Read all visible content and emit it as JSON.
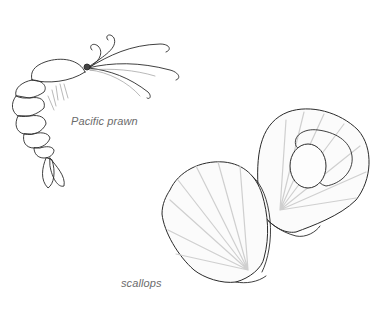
{
  "illustration": {
    "background": "#ffffff",
    "ink_color": "#2a2a2a",
    "subjects": [
      {
        "id": "prawn",
        "caption": "Pacific prawn"
      },
      {
        "id": "scallops",
        "caption": "scallops"
      }
    ]
  },
  "labels": {
    "prawn": "Pacific prawn",
    "scallops": "scallops"
  }
}
